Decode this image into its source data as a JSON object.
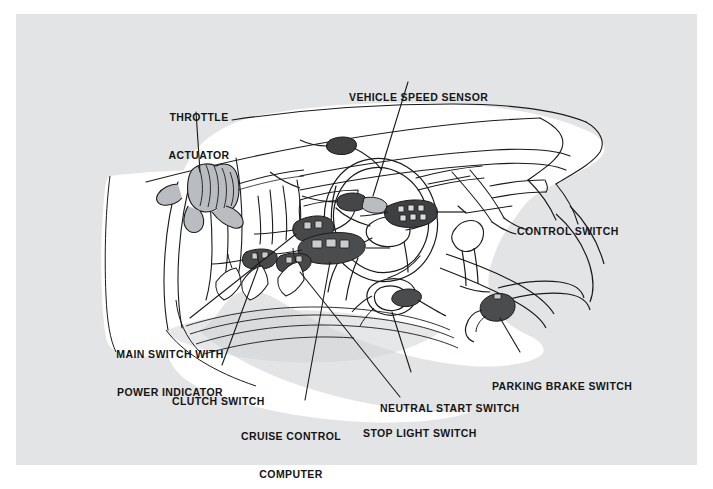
{
  "document": {
    "type": "technical-illustration",
    "subject": "Automotive cruise control system component location",
    "view": "Driver side vehicle interior cutaway, left-hand drive",
    "page_background": "#e3e4e5",
    "drawing_background": "#ffffff",
    "line_color": "#1a1a1a",
    "shading_color": "#b9bcc0"
  },
  "labels": [
    {
      "id": "throttle-actuator",
      "line1": "THROTTLE",
      "line2": "ACTUATOR",
      "align": "center",
      "x": 163,
      "y": 86,
      "leader": {
        "x1": 196,
        "y1": 112,
        "x2": 200,
        "y2": 172
      }
    },
    {
      "id": "vehicle-speed-sensor",
      "line1": "VEHICLE SPEED SENSOR",
      "line2": "",
      "align": "center",
      "x": 349,
      "y": 66,
      "leader": {
        "x1": 408,
        "y1": 82,
        "x2": 373,
        "y2": 196
      }
    },
    {
      "id": "control-switch",
      "line1": "CONTROL SWITCH",
      "line2": "",
      "align": "left",
      "x": 517,
      "y": 200,
      "leader": {
        "x1": 512,
        "y1": 206,
        "x2": 455,
        "y2": 214
      }
    },
    {
      "id": "main-switch-with-power-indicator",
      "line1": "MAIN SWITCH WITH",
      "line2": "POWER INDICATOR",
      "align": "center",
      "x": 118,
      "y": 323,
      "leader": {
        "x1": 190,
        "y1": 318,
        "x2": 296,
        "y2": 234
      }
    },
    {
      "id": "clutch-switch",
      "line1": "CLUTCH SWITCH",
      "line2": "",
      "align": "center",
      "x": 172,
      "y": 370,
      "leader": {
        "x1": 222,
        "y1": 365,
        "x2": 302,
        "y2": 254
      }
    },
    {
      "id": "cruise-control-computer",
      "line1": "CRUISE CONTROL",
      "line2": "COMPUTER",
      "align": "center",
      "x": 239,
      "y": 405,
      "leader": {
        "x1": 305,
        "y1": 400,
        "x2": 329,
        "y2": 246
      }
    },
    {
      "id": "stop-light-switch",
      "line1": "STOP LIGHT SWITCH",
      "line2": "",
      "align": "center",
      "x": 363,
      "y": 402,
      "leader": {
        "x1": 400,
        "y1": 397,
        "x2": 338,
        "y2": 210
      }
    },
    {
      "id": "neutral-start-switch",
      "line1": "NEUTRAL START SWITCH",
      "line2": "",
      "align": "center",
      "x": 391,
      "y": 377,
      "leader": {
        "x1": 411,
        "y1": 372,
        "x2": 386,
        "y2": 300
      }
    },
    {
      "id": "parking-brake-switch",
      "line1": "PARKING BRAKE SWITCH",
      "line2": "",
      "align": "center",
      "x": 492,
      "y": 357,
      "leader": {
        "x1": 520,
        "y1": 352,
        "x2": 494,
        "y2": 311
      }
    }
  ],
  "components": [
    {
      "id": "throttle-actuator",
      "note": "Round vacuum actuator canister mounted on bulkhead"
    },
    {
      "id": "vehicle-speed-sensor",
      "note": "Sensor at speedometer cable behind instrument cluster"
    },
    {
      "id": "control-switch",
      "note": "Stalk switch on steering column right side"
    },
    {
      "id": "main-switch-with-power-indicator",
      "note": "Dash panel switch left of steering column"
    },
    {
      "id": "clutch-switch",
      "note": "Switch on clutch pedal bracket"
    },
    {
      "id": "cruise-control-computer",
      "note": "Control unit under dash panel"
    },
    {
      "id": "stop-light-switch",
      "note": "Switch on brake pedal bracket"
    },
    {
      "id": "neutral-start-switch",
      "note": "Switch at shift linkage on floor console"
    },
    {
      "id": "parking-brake-switch",
      "note": "Switch on parking brake lever at console side"
    }
  ]
}
